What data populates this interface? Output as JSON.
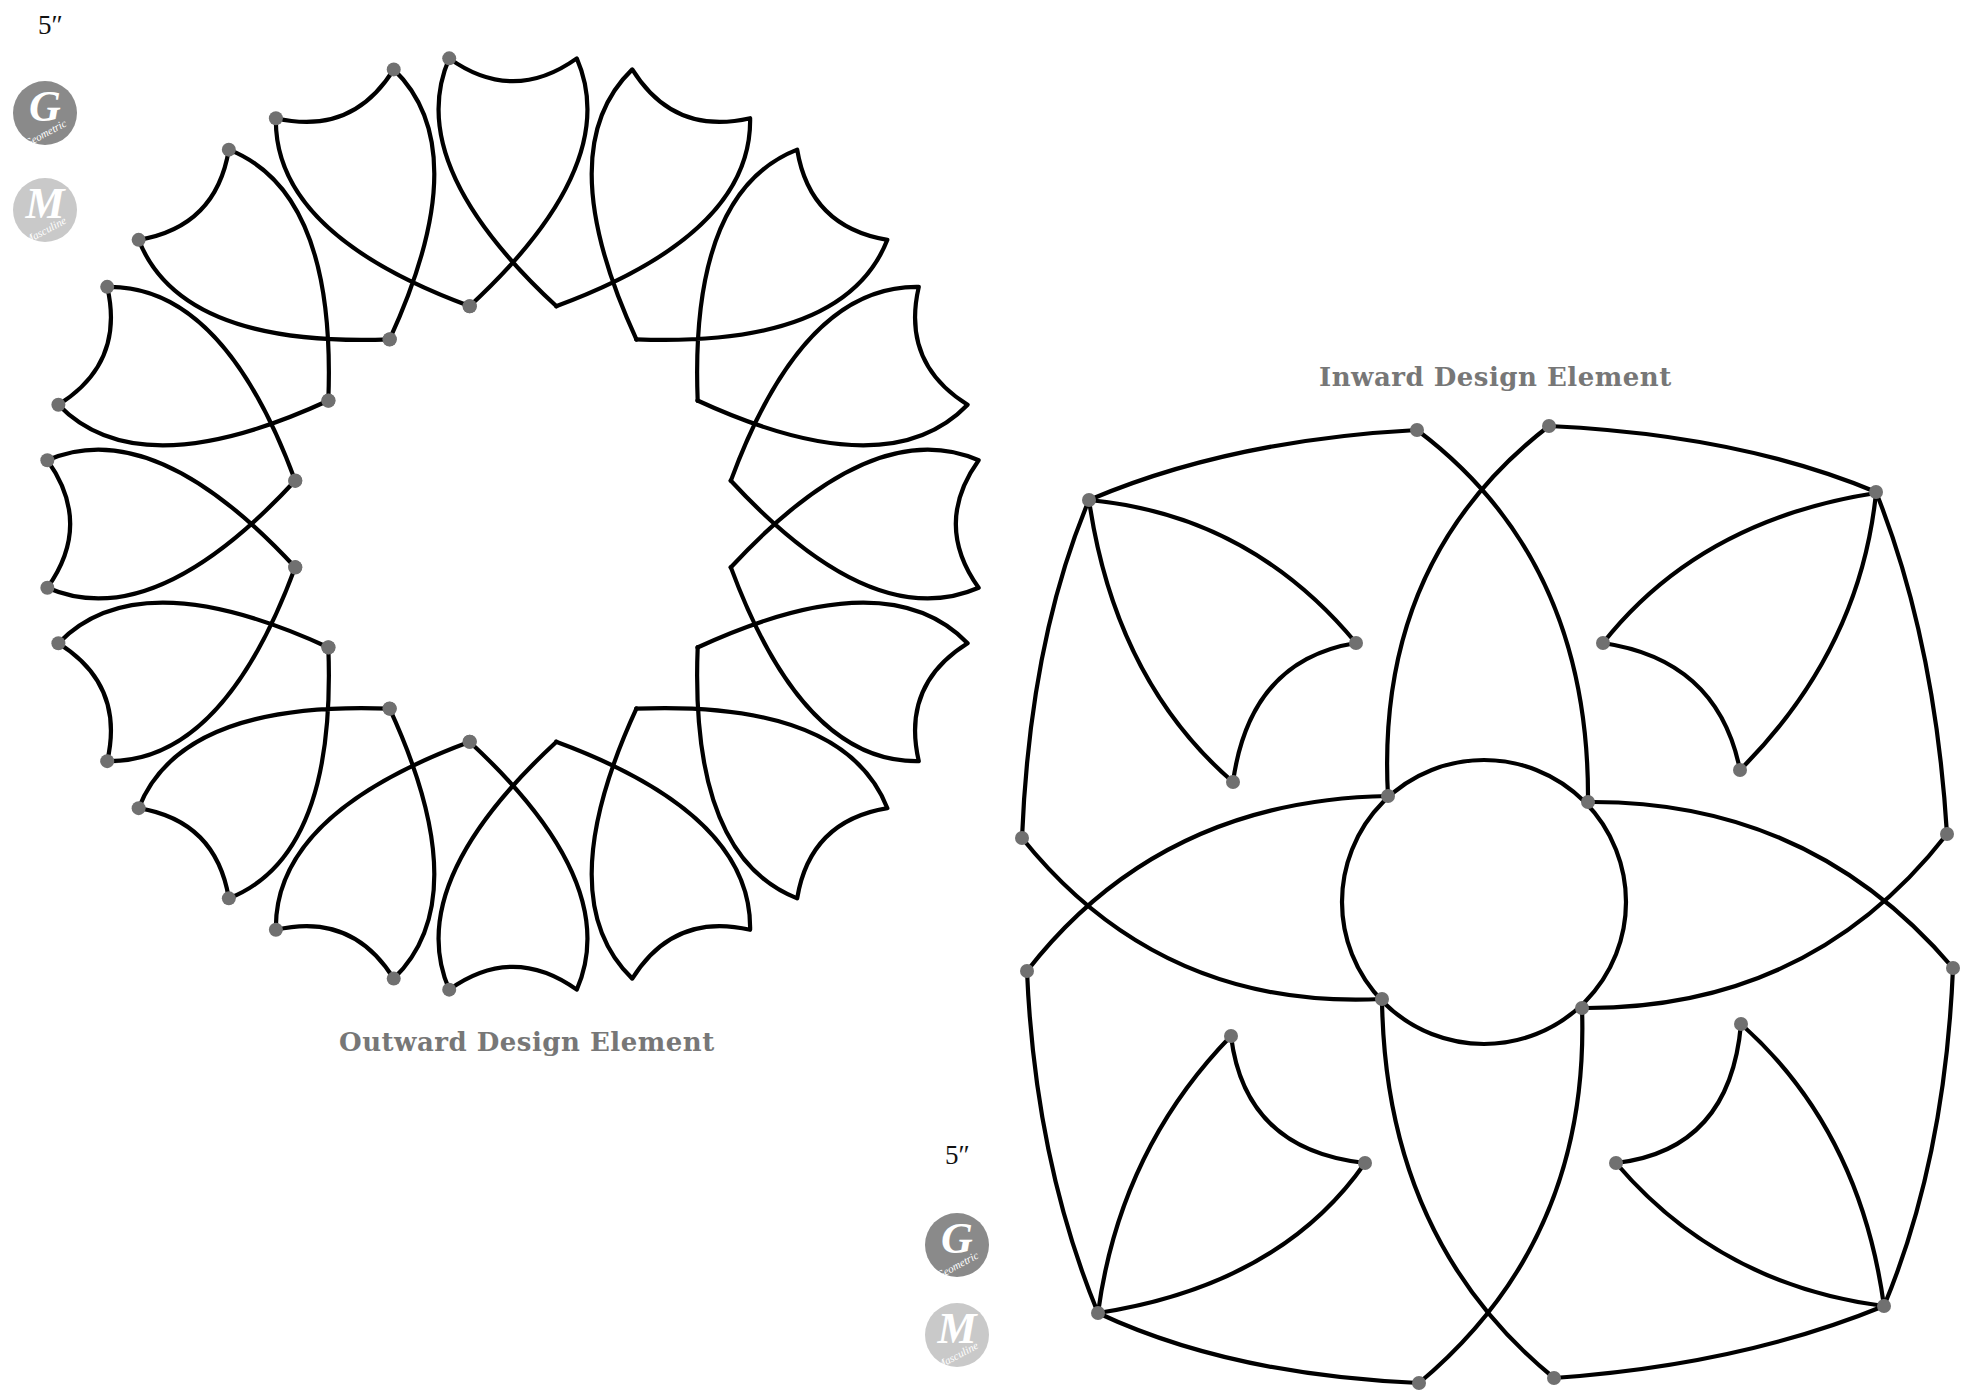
{
  "colors": {
    "line": "#000000",
    "dot": "#707070",
    "label": "#777777",
    "badge_g": "#8a8a8a",
    "badge_m": "#c9c9c9"
  },
  "outward": {
    "label": "Outward Design Element",
    "size": "5″",
    "badges": [
      {
        "letter": "G",
        "word": "Geometric"
      },
      {
        "letter": "M",
        "word": "Masculine"
      }
    ],
    "geometry": {
      "cx": 513,
      "cy": 524,
      "petals": 16,
      "r_outer": 470,
      "outer_half_angle_deg": 7.8,
      "r_inner": 222,
      "inner_half_angle_deg": 11.3
    }
  },
  "inward": {
    "label": "Inward Design Element",
    "size": "5″",
    "badges": [
      {
        "letter": "G",
        "word": "Geometric"
      },
      {
        "letter": "M",
        "word": "Masculine"
      }
    ],
    "circle": {
      "cx": 1484,
      "cy": 902,
      "r": 142
    }
  }
}
